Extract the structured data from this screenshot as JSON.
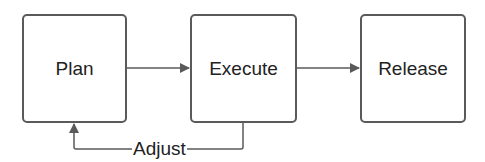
{
  "diagram": {
    "nodes": [
      {
        "id": "plan",
        "label": "Plan"
      },
      {
        "id": "execute",
        "label": "Execute"
      },
      {
        "id": "release",
        "label": "Release"
      }
    ],
    "edges": [
      {
        "from": "plan",
        "to": "execute",
        "label": ""
      },
      {
        "from": "execute",
        "to": "release",
        "label": ""
      },
      {
        "from": "execute",
        "to": "plan",
        "label": "Adjust"
      }
    ],
    "colors": {
      "stroke": "#5a5a5a",
      "text": "#222222",
      "background": "#ffffff"
    }
  }
}
